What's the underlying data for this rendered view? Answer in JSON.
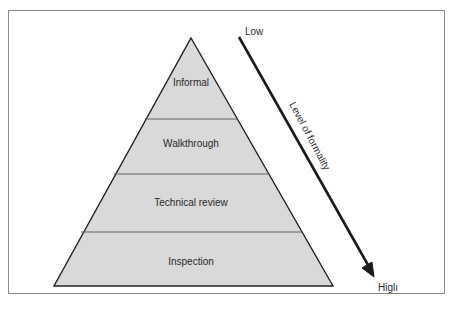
{
  "diagram": {
    "type": "pyramid",
    "levels": [
      {
        "label": "Informal"
      },
      {
        "label": "Walkthrough"
      },
      {
        "label": "Technical review"
      },
      {
        "label": "Inspection"
      }
    ],
    "axis": {
      "title": "Level of formality",
      "low_label": "Low",
      "high_label": "Higlı"
    },
    "colors": {
      "fill": "#d9d9d9",
      "outline": "#222222",
      "divider": "#555555",
      "frame": "#8a8a8a"
    }
  }
}
